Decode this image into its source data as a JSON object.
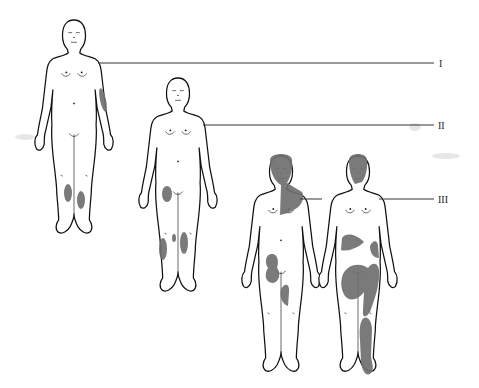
{
  "figure": {
    "type": "body-map-staging-diagram",
    "lesion_color": "#6f6f6f",
    "outline_color": "#111111",
    "background": "#ffffff",
    "stages": [
      {
        "label": "I",
        "figures": 1,
        "affected_areas": [
          "left upper arm (outer)",
          "both lower legs"
        ]
      },
      {
        "label": "II",
        "figures": 1,
        "affected_areas": [
          "right thigh",
          "both lower legs"
        ]
      },
      {
        "label": "III",
        "figures": 2,
        "affected_areas": [
          "head and neck",
          "right upper chest",
          "thigh",
          "trunk (flanks)",
          "upper thighs",
          "left lower leg"
        ]
      }
    ]
  }
}
